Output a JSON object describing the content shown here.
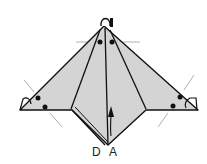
{
  "diagram": {
    "type": "origami-fold-step",
    "labels": {
      "left_point": "D",
      "right_point": "A"
    },
    "colors": {
      "paper": "#d4d4d4",
      "line": "#111111",
      "guide": "#999999",
      "background": "#ffffff"
    }
  }
}
